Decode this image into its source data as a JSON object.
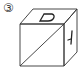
{
  "figure": {
    "label": "③",
    "top_face_letter": "D",
    "right_face_glyph": "ㅓ",
    "front_face": "diagonal line",
    "line_color": "#333333",
    "background": "#ffffff"
  }
}
